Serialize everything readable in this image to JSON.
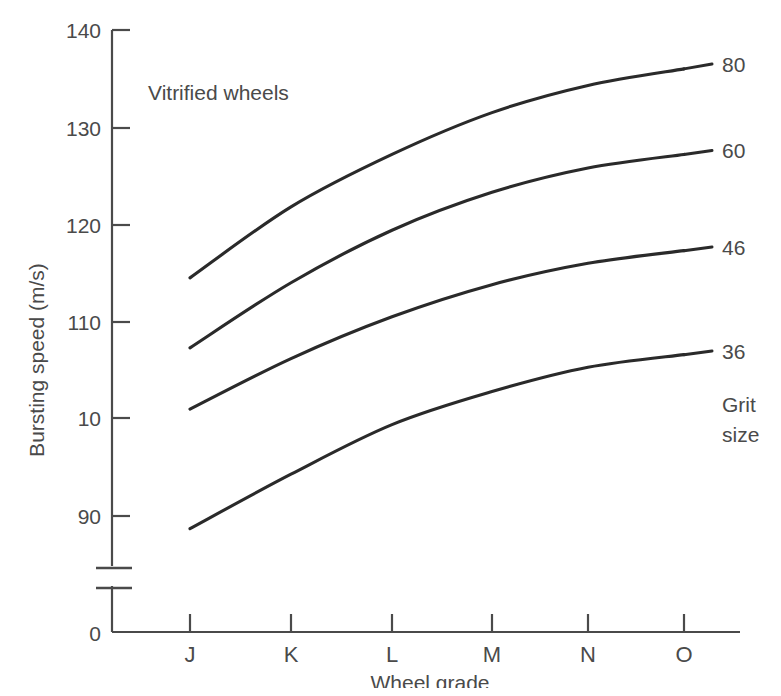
{
  "chart_data": {
    "type": "line",
    "title": "",
    "annotation": "Vitrified wheels",
    "xlabel": "Wheel grade",
    "ylabel": "Bursting speed (m/s)",
    "categories": [
      "J",
      "K",
      "L",
      "M",
      "N",
      "O"
    ],
    "y_tick_labels": [
      "140",
      "130",
      "120",
      "110",
      "10",
      "90",
      "0"
    ],
    "y_tick_values": [
      140,
      130,
      120,
      110,
      100,
      90,
      0
    ],
    "ylim": [
      85,
      142
    ],
    "axis_break": true,
    "grid": false,
    "legend_position": "right-inline",
    "legend_title": "Grit size",
    "legend_title_lines": [
      "Grit",
      "size"
    ],
    "series": [
      {
        "name": "80",
        "values": [
          114.5,
          121.8,
          127.2,
          131.5,
          134.3,
          136.0
        ]
      },
      {
        "name": "60",
        "values": [
          107.3,
          114.0,
          119.4,
          123.3,
          125.8,
          127.2
        ]
      },
      {
        "name": "46",
        "values": [
          101.0,
          106.2,
          110.5,
          113.8,
          116.0,
          117.3
        ]
      },
      {
        "name": "36",
        "values": [
          88.7,
          94.3,
          99.4,
          102.8,
          105.3,
          106.6
        ]
      }
    ],
    "colors": {
      "background": "#ffffff",
      "line": "#2a2a2a",
      "axis": "#4a4a4a",
      "text": "#4a4a4a"
    }
  },
  "axis": {
    "y_ticks": [
      {
        "label": "140"
      },
      {
        "label": "130"
      },
      {
        "label": "120"
      },
      {
        "label": "110"
      },
      {
        "label": "10"
      },
      {
        "label": "90"
      },
      {
        "label": "0"
      }
    ],
    "x_ticks": [
      {
        "label": "J"
      },
      {
        "label": "K"
      },
      {
        "label": "L"
      },
      {
        "label": "M"
      },
      {
        "label": "N"
      },
      {
        "label": "O"
      }
    ],
    "x_title": "Wheel grade",
    "y_title": "Bursting speed (m/s)"
  },
  "series_labels": [
    {
      "label": "80"
    },
    {
      "label": "60"
    },
    {
      "label": "46"
    },
    {
      "label": "36"
    }
  ],
  "legend": {
    "title_line1": "Grit",
    "title_line2": "size"
  },
  "plot_annotation": {
    "text": "Vitrified wheels"
  }
}
